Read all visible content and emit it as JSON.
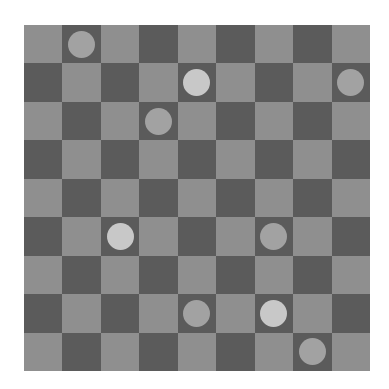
{
  "board": {
    "rows": 9,
    "cols": 9,
    "colors": {
      "light_square": "#8f8f8f",
      "dark_square": "#5b5b5b",
      "light_piece": "#c8c8c8",
      "gray_piece": "#a2a2a2"
    },
    "pieces": [
      {
        "row": 0,
        "col": 1,
        "type": "gray"
      },
      {
        "row": 1,
        "col": 4,
        "type": "light"
      },
      {
        "row": 1,
        "col": 8,
        "type": "gray"
      },
      {
        "row": 2,
        "col": 3,
        "type": "gray"
      },
      {
        "row": 5,
        "col": 2,
        "type": "light"
      },
      {
        "row": 5,
        "col": 6,
        "type": "gray"
      },
      {
        "row": 7,
        "col": 4,
        "type": "gray"
      },
      {
        "row": 7,
        "col": 6,
        "type": "light"
      },
      {
        "row": 8,
        "col": 7,
        "type": "gray"
      }
    ]
  }
}
